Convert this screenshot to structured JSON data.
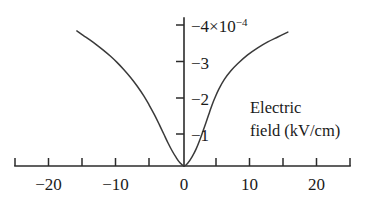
{
  "chart_data": {
    "type": "line",
    "title": "",
    "subtitle": "",
    "xlabel": "Electric field (kV/cm)",
    "ylabel": "",
    "y_scale_factor": "×10",
    "y_scale_exponent": "-4",
    "y_axis_top_label": "−4",
    "xlim": [
      -25,
      25
    ],
    "ylim": [
      -4.4,
      0
    ],
    "grid": false,
    "legend": "none",
    "x_ticks": [
      -25,
      -20,
      -15,
      -10,
      -5,
      0,
      5,
      10,
      15,
      20,
      25
    ],
    "x_tick_labels": [
      "",
      "−20",
      "",
      "−10",
      "",
      "0",
      "",
      "10",
      "",
      "20",
      ""
    ],
    "y_ticks": [
      -1,
      -2,
      -3,
      -4
    ],
    "y_tick_labels": [
      "−1",
      "−2",
      "−3",
      "−4"
    ],
    "series": [
      {
        "name": "absorption change",
        "x": [
          -16.0,
          -15.0,
          -14.0,
          -13.0,
          -12.0,
          -11.0,
          -10.0,
          -9.0,
          -8.0,
          -7.0,
          -6.0,
          -5.2,
          -4.4,
          -3.7,
          -3.0,
          -2.4,
          -1.8,
          -1.2,
          -0.6,
          0.0,
          0.6,
          1.2,
          1.8,
          2.4,
          3.0,
          3.4,
          3.8,
          4.2,
          4.6,
          5.2,
          6.0,
          7.0,
          8.0,
          9.5,
          11.0,
          12.5,
          14.0,
          15.5
        ],
        "y": [
          -3.83,
          -3.7,
          -3.57,
          -3.43,
          -3.28,
          -3.12,
          -2.94,
          -2.74,
          -2.52,
          -2.27,
          -1.99,
          -1.73,
          -1.45,
          -1.18,
          -0.9,
          -0.66,
          -0.44,
          -0.25,
          -0.09,
          0.0,
          -0.09,
          -0.26,
          -0.48,
          -0.76,
          -1.08,
          -1.3,
          -1.52,
          -1.74,
          -1.93,
          -2.18,
          -2.45,
          -2.7,
          -2.9,
          -3.15,
          -3.35,
          -3.52,
          -3.66,
          -3.8
        ]
      }
    ],
    "caption_lines": [
      "Electric",
      "field (kV/cm)"
    ]
  },
  "axis": {
    "x_axis_name": "electric-field-axis",
    "y_axis_name": "absorption-change-axis"
  },
  "labels": {
    "y_top": "−4",
    "y_multiplier": "×10",
    "y_exponent": "−4",
    "y_3": "−3",
    "y_2": "−2",
    "y_1": "−1",
    "x_minus20": "−20",
    "x_minus10": "−10",
    "x_zero": "0",
    "x_10": "10",
    "x_20": "20",
    "caption_line1": "Electric",
    "caption_line2": "field (kV/cm)"
  },
  "colors": {
    "curve": "#3a3a3a",
    "axis": "#2b2b2b",
    "text": "#1a1a1a",
    "background": "#ffffff"
  }
}
